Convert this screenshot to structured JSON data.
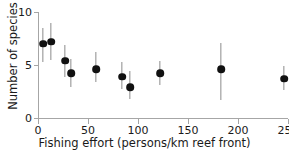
{
  "chart_data": {
    "type": "scatter",
    "title": "",
    "xlabel": "Fishing effort (persons/km reef front)",
    "ylabel": "Number of species",
    "xlim": [
      0,
      250
    ],
    "ylim": [
      0,
      10
    ],
    "xticks": [
      0,
      50,
      100,
      150,
      200,
      250
    ],
    "yticks": [
      0,
      5,
      10
    ],
    "xticklabels": [
      "0",
      "50",
      "100",
      "150",
      "200",
      "250"
    ],
    "yticklabels": [
      "0",
      "5",
      "10"
    ],
    "grid": false,
    "legend": null,
    "marker": "filled-circle",
    "marker_color": "#111111",
    "errorbar_color": "#8c8c8c",
    "axis_color": "#a6a6a6",
    "errorbar_type": "asymmetric-range",
    "points": [
      {
        "x": 5,
        "y": 7.0,
        "ylow": 5.3,
        "yhigh": 8.5
      },
      {
        "x": 13,
        "y": 7.2,
        "ylow": 5.5,
        "yhigh": 9.0
      },
      {
        "x": 27,
        "y": 5.4,
        "ylow": 3.9,
        "yhigh": 6.9
      },
      {
        "x": 33,
        "y": 4.2,
        "ylow": 2.9,
        "yhigh": 5.6
      },
      {
        "x": 58,
        "y": 4.6,
        "ylow": 3.4,
        "yhigh": 6.2
      },
      {
        "x": 84,
        "y": 3.9,
        "ylow": 2.7,
        "yhigh": 5.3
      },
      {
        "x": 92,
        "y": 2.9,
        "ylow": 1.8,
        "yhigh": 4.4
      },
      {
        "x": 122,
        "y": 4.2,
        "ylow": 3.1,
        "yhigh": 5.4
      },
      {
        "x": 183,
        "y": 4.6,
        "ylow": 1.7,
        "yhigh": 7.1
      },
      {
        "x": 246,
        "y": 3.7,
        "ylow": 2.6,
        "yhigh": 4.9
      }
    ]
  }
}
